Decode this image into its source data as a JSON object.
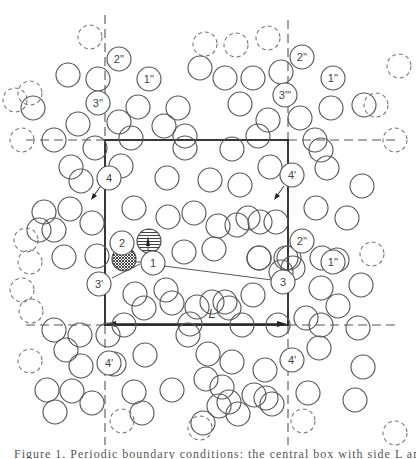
{
  "figure": {
    "type": "periodic-boundary-conditions-diagram",
    "box_length_label": "L",
    "labels": [
      {
        "text": "1",
        "x": 153,
        "y": 263
      },
      {
        "text": "2",
        "x": 122,
        "y": 243
      },
      {
        "text": "3",
        "x": 283,
        "y": 282
      },
      {
        "text": "3'",
        "x": 99,
        "y": 284
      },
      {
        "text": "4",
        "x": 109,
        "y": 178
      },
      {
        "text": "4'",
        "x": 292,
        "y": 175
      },
      {
        "text": "4'",
        "x": 109,
        "y": 363
      },
      {
        "text": "4'",
        "x": 292,
        "y": 360
      },
      {
        "text": "1''",
        "x": 149,
        "y": 79
      },
      {
        "text": "2''",
        "x": 119,
        "y": 59
      },
      {
        "text": "3''",
        "x": 98,
        "y": 103
      },
      {
        "text": "1''",
        "x": 333,
        "y": 78
      },
      {
        "text": "2''",
        "x": 302,
        "y": 57
      },
      {
        "text": "3'''",
        "x": 285,
        "y": 95
      },
      {
        "text": "2''",
        "x": 302,
        "y": 241
      },
      {
        "text": "1''",
        "x": 333,
        "y": 262
      }
    ]
  },
  "caption": {
    "text": "Figure 1. Periodic boundary conditions: the central box with side L and its periodic images"
  }
}
